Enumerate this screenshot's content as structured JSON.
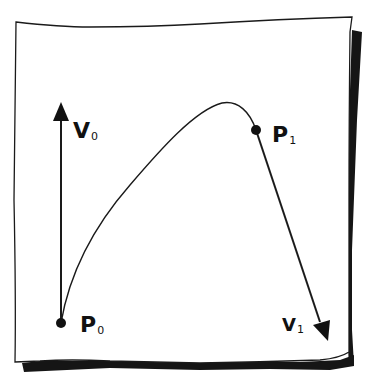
{
  "diagram": {
    "type": "hermite-curve-sketch",
    "colors": {
      "ink": "#1a1a1a",
      "paper": "#ffffff",
      "shadow": "#151515"
    },
    "labels": {
      "p0": {
        "main": "P",
        "sub": "0"
      },
      "p1": {
        "main": "P",
        "sub": "1"
      },
      "v0": {
        "main": "V",
        "sub": "0"
      },
      "v1": {
        "main": "V",
        "sub": "1"
      }
    },
    "points": {
      "p0": {
        "x": 61,
        "y": 323
      },
      "p1": {
        "x": 256,
        "y": 130
      }
    },
    "vectors": {
      "v0": {
        "from": [
          61,
          323
        ],
        "to": [
          61,
          104
        ]
      },
      "v1": {
        "from": [
          256,
          130
        ],
        "to": [
          327,
          340
        ]
      }
    },
    "curve": {
      "from": "p0",
      "to": "p1",
      "peak": [
        222,
        103
      ]
    }
  }
}
